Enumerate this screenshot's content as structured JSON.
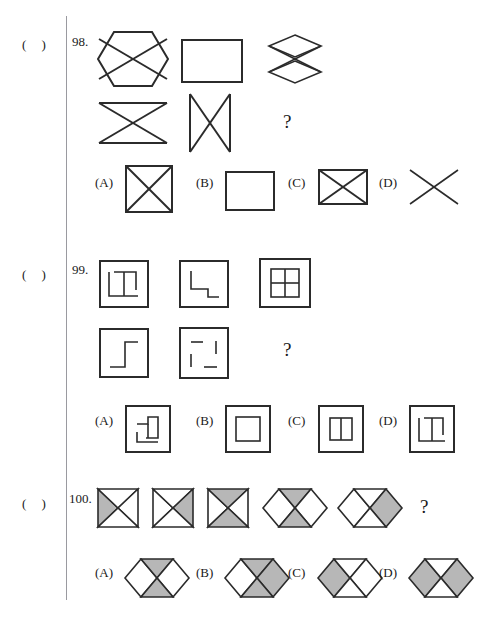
{
  "document": {
    "type": "multiple-choice-figure-reasoning-worksheet",
    "bracket_label": "(  )",
    "question_mark": "?"
  },
  "questions": [
    {
      "number": "98.",
      "bracket": "(  )",
      "answer_placeholder": "?",
      "stem_figures": [
        {
          "name": "hexagon-with-x",
          "shape": "hexagon",
          "lines": "x-cross"
        },
        {
          "name": "rectangle-plain",
          "shape": "rectangle",
          "lines": "none"
        },
        {
          "name": "double-diamond-bowtie",
          "shape": "stacked-diamonds",
          "lines": "x-cross"
        },
        {
          "name": "horizontal-bowtie",
          "shape": "bowtie-horizontal",
          "lines": "x-cross"
        },
        {
          "name": "vertical-bowtie",
          "shape": "bowtie-vertical",
          "lines": "x-cross"
        }
      ],
      "options": [
        {
          "label": "(A)",
          "name": "square-with-x",
          "shape": "square",
          "lines": "x-cross"
        },
        {
          "label": "(B)",
          "name": "rectangle-plain",
          "shape": "rectangle",
          "lines": "none"
        },
        {
          "label": "(C)",
          "name": "wide-rectangle-with-x",
          "shape": "wide-rectangle",
          "lines": "x-cross"
        },
        {
          "label": "(D)",
          "name": "bare-x-cross",
          "shape": "none",
          "lines": "x-cross"
        }
      ]
    },
    {
      "number": "99.",
      "bracket": "(  )",
      "answer_placeholder": "?",
      "stem_figures": [
        {
          "name": "square-with-t-glyph",
          "shape": "square",
          "inner": "t-shaped-lines"
        },
        {
          "name": "square-with-step-glyph",
          "shape": "square",
          "inner": "step-down-lines"
        },
        {
          "name": "square-with-grid",
          "shape": "square",
          "inner": "four-pane-grid"
        },
        {
          "name": "square-with-z-step-glyph",
          "shape": "square",
          "inner": "z-step-lines"
        },
        {
          "name": "square-with-broken-dashes",
          "shape": "square",
          "inner": "four-dashes"
        }
      ],
      "options": [
        {
          "label": "(A)",
          "name": "square-with-pinwheel-glyph",
          "shape": "square",
          "inner": "pinwheel-lines"
        },
        {
          "label": "(B)",
          "name": "square-with-inner-square",
          "shape": "square",
          "inner": "concentric-square"
        },
        {
          "label": "(C)",
          "name": "square-with-two-panes",
          "shape": "square",
          "inner": "two-pane-split"
        },
        {
          "label": "(D)",
          "name": "square-with-t-glyph",
          "shape": "square",
          "inner": "t-shaped-lines"
        }
      ]
    },
    {
      "number": "100.",
      "bracket": "(  )",
      "answer_placeholder": "?",
      "stem_figures": [
        {
          "name": "square-x-left-shaded",
          "shape": "square-x",
          "shaded": [
            "left"
          ]
        },
        {
          "name": "square-x-right-shaded",
          "shape": "square-x",
          "shaded": [
            "right"
          ]
        },
        {
          "name": "square-x-top-bottom-shaded",
          "shape": "square-x",
          "shaded": [
            "top",
            "bottom"
          ]
        },
        {
          "name": "hexagon-x-top-bottom-shaded",
          "shape": "hexagon-x",
          "shaded": [
            "top",
            "bottom"
          ]
        },
        {
          "name": "hexagon-x-right-shaded",
          "shape": "hexagon-x",
          "shaded": [
            "right"
          ]
        }
      ],
      "options": [
        {
          "label": "(A)",
          "name": "hexagon-x-top-bottom-shaded",
          "shape": "hexagon-x",
          "shaded": [
            "top",
            "bottom"
          ]
        },
        {
          "label": "(B)",
          "name": "hexagon-x-top-bottom-right-shaded",
          "shape": "hexagon-x",
          "shaded": [
            "top",
            "bottom",
            "right"
          ]
        },
        {
          "label": "(C)",
          "name": "hexagon-x-left-shaded",
          "shape": "hexagon-x",
          "shaded": [
            "left"
          ]
        },
        {
          "label": "(D)",
          "name": "hexagon-x-left-right-shaded",
          "shape": "hexagon-x",
          "shaded": [
            "left",
            "right"
          ]
        }
      ]
    }
  ],
  "colors": {
    "ink": "#2b2b2b",
    "shade": "#b7b7b7",
    "rule": "#9a9aa0",
    "paper": "#ffffff"
  }
}
